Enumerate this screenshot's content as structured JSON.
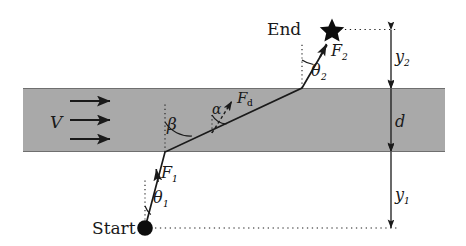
{
  "figure": {
    "background_color": "#ffffff",
    "band_color": "#a9a9a9",
    "stroke_color": "#1a1a1a"
  },
  "labels": {
    "start": "Start",
    "end": "End",
    "velocity": "V",
    "force_start": "F",
    "force_start_sub": "1",
    "force_end": "F",
    "force_end_sub": "2",
    "force_drag": "F",
    "force_drag_sub": "d",
    "theta_start": "θ",
    "theta_start_sub": "1",
    "theta_end": "θ",
    "theta_end_sub": "2",
    "beta": "β",
    "alpha": "α",
    "band_width": "d",
    "dist_lower": "y",
    "dist_lower_sub": "1",
    "dist_upper": "y",
    "dist_upper_sub": "2"
  },
  "geometry": {
    "band": {
      "x": 23,
      "y": 88,
      "width": 422,
      "height": 64
    },
    "start_point": {
      "x": 145,
      "y": 228
    },
    "end_point": {
      "x": 332,
      "y": 29
    },
    "entry_point": {
      "x": 165,
      "y": 152
    },
    "exit_point": {
      "x": 302,
      "y": 88
    },
    "measure_line_x": 391,
    "velocity_arrows_y": [
      101,
      120,
      138
    ],
    "velocity_arrow_x": [
      70,
      112
    ]
  }
}
